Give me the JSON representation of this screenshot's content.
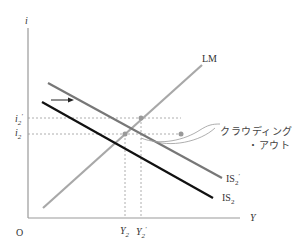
{
  "diagram": {
    "type": "IS-LM diagram",
    "axes": {
      "y_label": "i",
      "x_label": "Y",
      "origin_label": "O"
    },
    "curves": [
      {
        "name": "LM",
        "label": "LM",
        "color": "#a8a8a8"
      },
      {
        "name": "IS2-prime",
        "label_main": "IS",
        "label_sub": "2",
        "label_sup": "′",
        "color": "#777777"
      },
      {
        "name": "IS2",
        "label_main": "IS",
        "label_sub": "2",
        "color": "#111111"
      }
    ],
    "y_ticks": [
      {
        "main": "i",
        "sub": "2",
        "sup": "′"
      },
      {
        "main": "i",
        "sub": "2"
      }
    ],
    "x_ticks": [
      {
        "main": "Y",
        "sub": "2"
      },
      {
        "main": "Y",
        "sub": "2",
        "sup": "′"
      }
    ],
    "annotation": {
      "line1": "クラウディング",
      "line2": "・アウト"
    },
    "shift_arrow": "right-arrow"
  }
}
